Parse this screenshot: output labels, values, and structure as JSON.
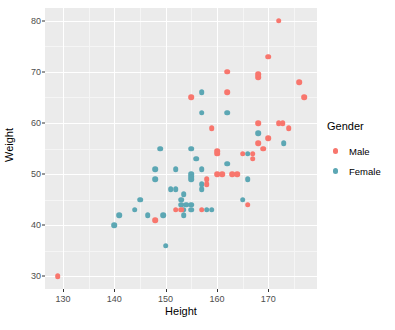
{
  "chart_data": {
    "type": "scatter",
    "title": "",
    "xlabel": "Height",
    "ylabel": "Weight",
    "xlim": [
      126.5,
      179.5
    ],
    "ylim": [
      27.5,
      82.5
    ],
    "xticks": [
      130,
      140,
      150,
      160,
      170
    ],
    "yticks": [
      30,
      40,
      50,
      60,
      70,
      80
    ],
    "xminor": [
      135,
      145,
      155,
      165,
      175
    ],
    "yminor": [
      35,
      45,
      55,
      65,
      75
    ],
    "grid": true,
    "legend": {
      "title": "Gender",
      "position": "right",
      "entries": [
        {
          "name": "Male",
          "color": "#F8766D"
        },
        {
          "name": "Female",
          "color": "#5CA7B4"
        }
      ]
    },
    "series": [
      {
        "name": "Male",
        "color": "#F8766D",
        "points": [
          [
            129,
            30
          ],
          [
            148,
            41
          ],
          [
            152,
            43
          ],
          [
            153,
            43
          ],
          [
            155,
            65
          ],
          [
            157,
            43
          ],
          [
            158,
            49
          ],
          [
            158,
            48
          ],
          [
            159,
            59
          ],
          [
            160,
            54
          ],
          [
            160,
            54.5
          ],
          [
            160,
            50
          ],
          [
            161,
            50
          ],
          [
            162,
            70
          ],
          [
            162,
            66
          ],
          [
            163,
            50
          ],
          [
            164,
            50
          ],
          [
            165,
            54
          ],
          [
            166,
            44
          ],
          [
            167,
            54
          ],
          [
            167,
            53
          ],
          [
            168,
            60
          ],
          [
            168,
            56
          ],
          [
            168,
            69
          ],
          [
            168,
            69.5
          ],
          [
            169,
            55
          ],
          [
            170,
            73
          ],
          [
            170,
            57
          ],
          [
            172,
            60
          ],
          [
            172.8,
            60
          ],
          [
            172,
            80
          ],
          [
            174,
            59
          ],
          [
            176,
            68
          ],
          [
            177,
            65
          ]
        ]
      },
      {
        "name": "Female",
        "color": "#5CA7B4"
      }
    ]
  },
  "female_points": [
    [
      140,
      40
    ],
    [
      141,
      42
    ],
    [
      144,
      43
    ],
    [
      145,
      45
    ],
    [
      146.5,
      42
    ],
    [
      148,
      51
    ],
    [
      148,
      49
    ],
    [
      149,
      55
    ],
    [
      149.5,
      42
    ],
    [
      150,
      36
    ],
    [
      151,
      47
    ],
    [
      152,
      47
    ],
    [
      152,
      51
    ],
    [
      153,
      45
    ],
    [
      153,
      44
    ],
    [
      153.5,
      46
    ],
    [
      153.5,
      43
    ],
    [
      153.5,
      42
    ],
    [
      154,
      44
    ],
    [
      155,
      55
    ],
    [
      155,
      49
    ],
    [
      155,
      49.5
    ],
    [
      155,
      50
    ],
    [
      155,
      44
    ],
    [
      155,
      43
    ],
    [
      156,
      53
    ],
    [
      157,
      51
    ],
    [
      157,
      47
    ],
    [
      157,
      48
    ],
    [
      157,
      66
    ],
    [
      157,
      62
    ],
    [
      158,
      43
    ],
    [
      159,
      43
    ],
    [
      162,
      62
    ],
    [
      162,
      52
    ],
    [
      165,
      45
    ],
    [
      166,
      49
    ],
    [
      166,
      54
    ],
    [
      168,
      58
    ],
    [
      173,
      56
    ]
  ]
}
